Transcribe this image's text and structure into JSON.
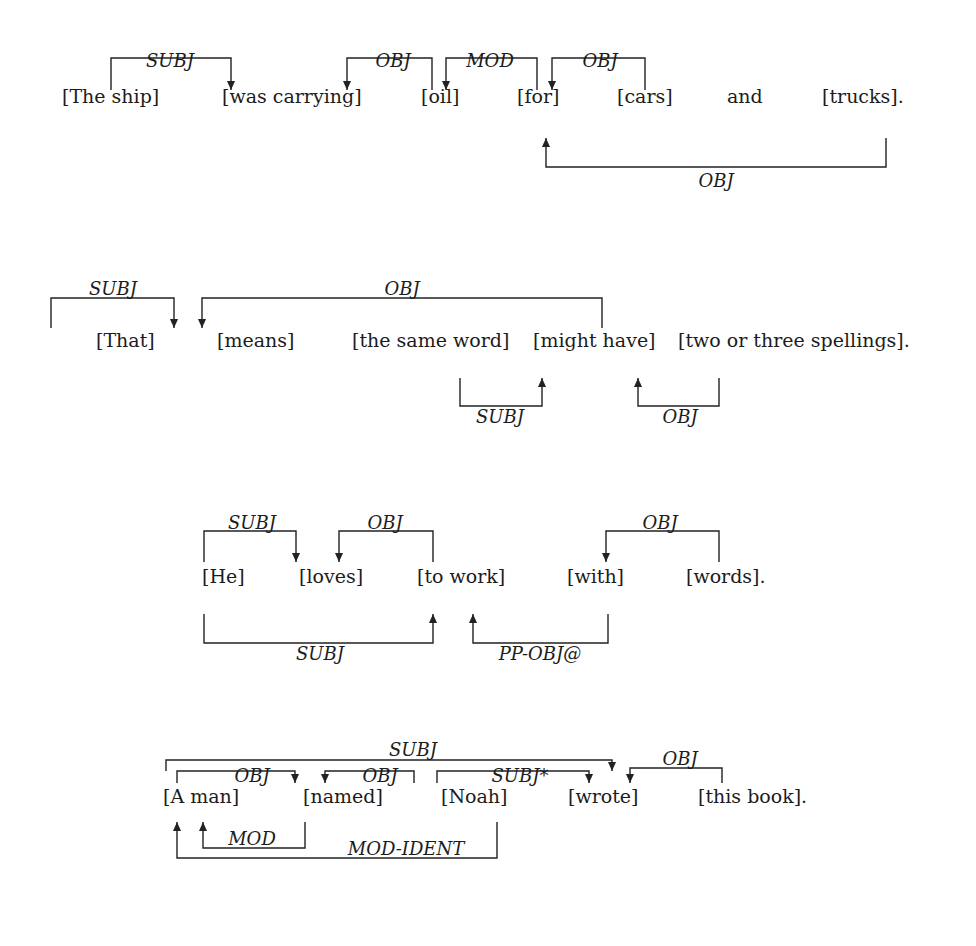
{
  "diagram": {
    "type": "dependency-parse",
    "sentences": [
      {
        "id": "s1",
        "words": [
          {
            "text": "[The ship]",
            "x": 62,
            "y": 102
          },
          {
            "text": "[was carrying]",
            "x": 222,
            "y": 102
          },
          {
            "text": "[oil]",
            "x": 421,
            "y": 102
          },
          {
            "text": "[for]",
            "x": 517,
            "y": 102
          },
          {
            "text": "[cars]",
            "x": 617,
            "y": 102
          },
          {
            "text": "and",
            "x": 727,
            "y": 102
          },
          {
            "text": "[trucks].",
            "x": 822,
            "y": 102
          }
        ],
        "arcs": [
          {
            "label": "SUBJ",
            "side": "above",
            "from_x": 111,
            "to_x": 231,
            "bar_y": 90,
            "end_y": 58,
            "arrow_at": "to",
            "label_x": 170,
            "label_y": 52
          },
          {
            "label": "OBJ",
            "side": "above",
            "from_x": 432,
            "to_x": 347,
            "bar_y": 90,
            "end_y": 58,
            "arrow_at": "to",
            "label_x": 393,
            "label_y": 52
          },
          {
            "label": "MOD",
            "side": "above",
            "from_x": 537,
            "to_x": 446,
            "bar_y": 90,
            "end_y": 58,
            "arrow_at": "to",
            "label_x": 490,
            "label_y": 52
          },
          {
            "label": "OBJ",
            "side": "above",
            "from_x": 645,
            "to_x": 552,
            "bar_y": 90,
            "end_y": 58,
            "arrow_at": "to",
            "label_x": 600,
            "label_y": 52
          },
          {
            "label": "OBJ",
            "side": "below",
            "from_x": 886,
            "to_x": 546,
            "bar_y": 138,
            "end_y": 167,
            "arrow_at": "to",
            "label_x": 716,
            "label_y": 172
          }
        ]
      },
      {
        "id": "s2",
        "words": [
          {
            "text": "[That]",
            "x": 96,
            "y": 346
          },
          {
            "text": "[means]",
            "x": 217,
            "y": 346
          },
          {
            "text": "[the same word]",
            "x": 352,
            "y": 346
          },
          {
            "text": "[might have]",
            "x": 533,
            "y": 346
          },
          {
            "text": "[two or three spellings].",
            "x": 678,
            "y": 346
          }
        ],
        "arcs": [
          {
            "label": "SUBJ",
            "side": "above",
            "from_x": 51,
            "to_x": 174,
            "bar_y": 328,
            "end_y": 298,
            "arrow_at": "to",
            "label_x": 113,
            "label_y": 280
          },
          {
            "label": "OBJ",
            "side": "above",
            "from_x": 602,
            "to_x": 202,
            "bar_y": 328,
            "end_y": 298,
            "arrow_at": "to",
            "label_x": 402,
            "label_y": 280
          },
          {
            "label": "SUBJ",
            "side": "below",
            "from_x": 460,
            "to_x": 542,
            "bar_y": 378,
            "end_y": 406,
            "arrow_at": "to",
            "label_x": 500,
            "label_y": 408
          },
          {
            "label": "OBJ",
            "side": "below",
            "from_x": 719,
            "to_x": 638,
            "bar_y": 378,
            "end_y": 406,
            "arrow_at": "to",
            "label_x": 680,
            "label_y": 408
          }
        ]
      },
      {
        "id": "s3",
        "words": [
          {
            "text": "[He]",
            "x": 202,
            "y": 582
          },
          {
            "text": "[loves]",
            "x": 299,
            "y": 582
          },
          {
            "text": "[to work]",
            "x": 417,
            "y": 582
          },
          {
            "text": "[with]",
            "x": 567,
            "y": 582
          },
          {
            "text": "[words].",
            "x": 686,
            "y": 582
          }
        ],
        "arcs": [
          {
            "label": "SUBJ",
            "side": "above",
            "from_x": 204,
            "to_x": 296,
            "bar_y": 562,
            "end_y": 531,
            "arrow_at": "to",
            "label_x": 252,
            "label_y": 514
          },
          {
            "label": "OBJ",
            "side": "above",
            "from_x": 433,
            "to_x": 339,
            "bar_y": 562,
            "end_y": 531,
            "arrow_at": "to",
            "label_x": 385,
            "label_y": 514
          },
          {
            "label": "OBJ",
            "side": "above",
            "from_x": 719,
            "to_x": 606,
            "bar_y": 562,
            "end_y": 531,
            "arrow_at": "to",
            "label_x": 660,
            "label_y": 514
          },
          {
            "label": "SUBJ",
            "side": "below",
            "from_x": 204,
            "to_x": 433,
            "bar_y": 614,
            "end_y": 643,
            "arrow_at": "to",
            "label_x": 320,
            "label_y": 645
          },
          {
            "label": "PP-OBJ@",
            "side": "below",
            "from_x": 608,
            "to_x": 473,
            "bar_y": 614,
            "end_y": 643,
            "arrow_at": "to",
            "label_x": 540,
            "label_y": 645
          }
        ]
      },
      {
        "id": "s4",
        "words": [
          {
            "text": "[A man]",
            "x": 163,
            "y": 802
          },
          {
            "text": "[named]",
            "x": 303,
            "y": 802
          },
          {
            "text": "[Noah]",
            "x": 441,
            "y": 802
          },
          {
            "text": "[wrote]",
            "x": 568,
            "y": 802
          },
          {
            "text": "[this book].",
            "x": 698,
            "y": 802
          }
        ],
        "arcs": [
          {
            "label": "SUBJ",
            "side": "above",
            "from_x": 166,
            "to_x": 612,
            "bar_y": 771,
            "end_y": 760,
            "arrow_at": "to",
            "label_x": 413,
            "label_y": 741
          },
          {
            "label": "OBJ",
            "side": "above",
            "from_x": 177,
            "to_x": 295,
            "bar_y": 783,
            "end_y": 771,
            "arrow_at": "to",
            "label_x": 252,
            "label_y": 767
          },
          {
            "label": "OBJ",
            "side": "above",
            "from_x": 414,
            "to_x": 325,
            "bar_y": 783,
            "end_y": 771,
            "arrow_at": "to",
            "label_x": 380,
            "label_y": 767
          },
          {
            "label": "SUBJ*",
            "side": "above",
            "from_x": 437,
            "to_x": 589,
            "bar_y": 783,
            "end_y": 771,
            "arrow_at": "to",
            "label_x": 520,
            "label_y": 767
          },
          {
            "label": "OBJ",
            "side": "above",
            "from_x": 722,
            "to_x": 630,
            "bar_y": 783,
            "end_y": 768,
            "arrow_at": "to",
            "label_x": 680,
            "label_y": 750
          },
          {
            "label": "MOD",
            "side": "below",
            "from_x": 305,
            "to_x": 203,
            "bar_y": 822,
            "end_y": 848,
            "arrow_at": "to",
            "label_x": 252,
            "label_y": 830
          },
          {
            "label": "MOD-IDENT",
            "side": "below",
            "from_x": 497,
            "to_x": 177,
            "bar_y": 822,
            "end_y": 858,
            "arrow_at": "to",
            "label_x": 406,
            "label_y": 840
          }
        ]
      }
    ]
  },
  "colors": {
    "background": "#ffffff",
    "ink": "#1c1c1c"
  }
}
